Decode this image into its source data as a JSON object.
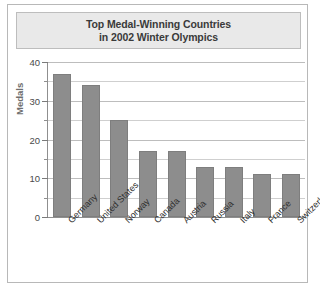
{
  "figure": {
    "title_lines": [
      "Top Medal-Winning Countries",
      "in 2002 Winter Olympics"
    ],
    "bar_color": "#8d8d8d",
    "title_background": "#e9e9e9",
    "frame_border": "#b8b8b8"
  },
  "chart_data": {
    "type": "bar",
    "title": "Top Medal-Winning Countries in 2002 Winter Olympics",
    "categories": [
      "Germany",
      "United States",
      "Norway",
      "Canada",
      "Austria",
      "Russia",
      "Italy",
      "France",
      "Switzerland"
    ],
    "values": [
      37,
      34,
      25,
      17,
      17,
      13,
      13,
      11,
      11
    ],
    "xlabel": "",
    "ylabel": "Medals",
    "ylim": [
      0,
      40
    ],
    "ytick_labels": [
      "0",
      "10",
      "20",
      "30",
      "40"
    ],
    "ytick_values": [
      0,
      10,
      20,
      30,
      40
    ],
    "minor_tick_values": [
      5,
      15,
      25,
      35
    ],
    "grid": true,
    "legend": "none"
  }
}
